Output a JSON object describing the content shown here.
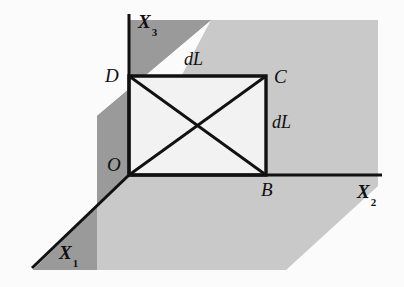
{
  "figure": {
    "type": "technical-diagram",
    "background_color": "#fbfbfb",
    "colors": {
      "plane_x1x3_fill": "#9a9a9a",
      "plane_x1x2_fill": "#c9c9c9",
      "element_fill": "#f2f2f2",
      "line_color": "#111111",
      "text_color": "#101010"
    },
    "axes": [
      {
        "name": "x1-axis",
        "label": "X",
        "subscript": "1",
        "direction": "down-left-diagonal"
      },
      {
        "name": "x2-axis",
        "label": "X",
        "subscript": "2",
        "direction": "right-horizontal"
      },
      {
        "name": "x3-axis",
        "label": "X",
        "subscript": "3",
        "direction": "up-vertical"
      }
    ],
    "points": [
      {
        "name": "point-o",
        "label": "O",
        "role": "origin",
        "x": 129,
        "y": 175
      },
      {
        "name": "point-b",
        "label": "B",
        "role": "bottom-right-corner",
        "x": 266,
        "y": 175
      },
      {
        "name": "point-c",
        "label": "C",
        "role": "top-right-corner",
        "x": 266,
        "y": 76
      },
      {
        "name": "point-d",
        "label": "D",
        "role": "top-left-corner",
        "x": 129,
        "y": 76
      }
    ],
    "dimensions": [
      {
        "name": "dimension-top",
        "label": "dL",
        "edge": "DC"
      },
      {
        "name": "dimension-right",
        "label": "dL",
        "edge": "CB"
      }
    ],
    "element": {
      "name": "area-element-obcd",
      "vertices": [
        "O",
        "B",
        "C",
        "D"
      ],
      "diagonals": [
        "O-C",
        "D-B"
      ]
    }
  }
}
